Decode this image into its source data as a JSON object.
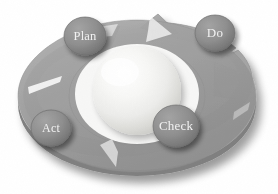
{
  "diagram": {
    "type": "cycle-wheel",
    "background_color": "#ffffff",
    "ring_color": "#9a9a9a",
    "ring_shadow_color": "#c9c9c9",
    "ring_edge_color": "#8a8a8a",
    "sphere_color": "#f4f4f2",
    "sphere_shade_color": "#d8d8d4",
    "badge_color": "#8f8f8f",
    "badge_edge_color": "#6f6f6f",
    "badge_text_color": "#f2f2f2",
    "stages": [
      {
        "id": "plan",
        "label": "Plan",
        "position": "top-left",
        "cx": 85,
        "cy": 36,
        "rx": 21,
        "ry": 19
      },
      {
        "id": "do",
        "label": "Do",
        "position": "top-right",
        "cx": 215,
        "cy": 33,
        "rx": 20,
        "ry": 18
      },
      {
        "id": "check",
        "label": "Check",
        "position": "bottom-right",
        "cx": 176,
        "cy": 126,
        "rx": 23,
        "ry": 21
      },
      {
        "id": "act",
        "label": "Act",
        "position": "bottom-left",
        "cx": 51,
        "cy": 128,
        "rx": 20,
        "ry": 18
      }
    ],
    "arrow_segments": [
      {
        "id": "segment-act-to-plan",
        "from": "Act",
        "to": "Plan"
      },
      {
        "id": "segment-plan-to-do",
        "from": "Plan",
        "to": "Do"
      },
      {
        "id": "segment-do-to-check",
        "from": "Do",
        "to": "Check"
      },
      {
        "id": "segment-check-to-act",
        "from": "Check",
        "to": "Act"
      }
    ],
    "center_sphere": {
      "id": "center-sphere",
      "cx": 137,
      "cy": 91,
      "rx": 44,
      "ry": 44
    }
  }
}
